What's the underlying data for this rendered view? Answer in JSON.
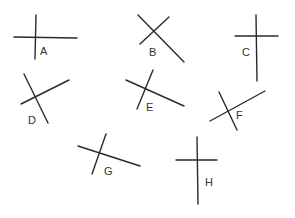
{
  "figures": [
    {
      "label": "A",
      "label_pos": [
        40,
        55
      ],
      "lines": [
        [
          14,
          37,
          77,
          38
        ],
        [
          36,
          15,
          35,
          59
        ]
      ]
    },
    {
      "label": "B",
      "label_pos": [
        149,
        56
      ],
      "lines": [
        [
          169,
          17,
          140,
          44
        ],
        [
          138,
          15,
          184,
          62
        ]
      ]
    },
    {
      "label": "C",
      "label_pos": [
        242,
        56
      ],
      "lines": [
        [
          235,
          36,
          278,
          36
        ],
        [
          256,
          15,
          257,
          81
        ]
      ]
    },
    {
      "label": "D",
      "label_pos": [
        28,
        124
      ],
      "lines": [
        [
          24,
          74,
          48,
          123
        ],
        [
          21,
          104,
          69,
          80
        ]
      ]
    },
    {
      "label": "E",
      "label_pos": [
        146,
        111
      ],
      "lines": [
        [
          153,
          70,
          137,
          109
        ],
        [
          126,
          80,
          184,
          106
        ]
      ]
    },
    {
      "label": "F",
      "label_pos": [
        236,
        119
      ],
      "lines": [
        [
          210,
          121,
          265,
          91
        ],
        [
          219,
          92,
          237,
          130
        ]
      ]
    },
    {
      "label": "G",
      "label_pos": [
        104,
        175
      ],
      "lines": [
        [
          78,
          146,
          140,
          166
        ],
        [
          106,
          134,
          92,
          174
        ]
      ]
    },
    {
      "label": "H",
      "label_pos": [
        205,
        186
      ],
      "lines": [
        [
          176,
          160,
          217,
          160
        ],
        [
          197,
          137,
          198,
          204
        ]
      ]
    }
  ],
  "colors": {
    "line": "#2a2a2a",
    "label": "#333333",
    "background": "#ffffff"
  }
}
